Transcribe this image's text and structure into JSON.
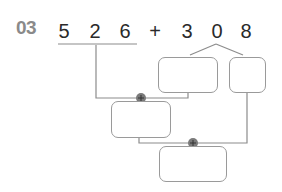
{
  "problem": {
    "number": "03",
    "expression": {
      "left_digits": [
        "5",
        "2",
        "6"
      ],
      "operator": "+",
      "right_digits": [
        "3",
        "0",
        "8"
      ]
    },
    "decomposition": {
      "source": "308",
      "parts": [
        "",
        ""
      ]
    },
    "operations": [
      {
        "symbol": "+",
        "operands": [
          "526",
          "box-a"
        ],
        "result": ""
      },
      {
        "symbol": "+",
        "operands": [
          "box-c",
          "box-b"
        ],
        "result": ""
      }
    ]
  },
  "colors": {
    "line": "#8c8c8c",
    "box_border": "#9a9a9a",
    "number_label": "#8a8a8a",
    "digit_text": "#2a2a2a",
    "plus_circle": "#7a7a7a"
  }
}
